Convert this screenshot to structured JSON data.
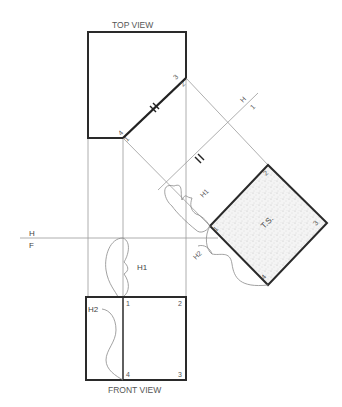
{
  "diagram": {
    "top_view_title": "TOP VIEW",
    "front_view_title": "FRONT VIEW",
    "fold_line_hf": {
      "upper": "H",
      "lower": "F"
    },
    "fold_line_h1": {
      "upper": "H",
      "lower": "1"
    },
    "true_shape_label": "T.S.",
    "distance_labels": {
      "h1": "H1",
      "h2": "H2"
    },
    "top_view_points": {
      "p4_1_left": "4",
      "p4_1_right": "1",
      "p3_2_top": "3",
      "p3_2_bottom": "2"
    },
    "front_view_points": {
      "p1": "1",
      "p2": "2",
      "p3": "3",
      "p4": "4"
    },
    "aux_view_points": {
      "p1": "1",
      "p2": "2",
      "p3": "3",
      "p4": "4"
    },
    "colors": {
      "thick_line": "#2a2a2a",
      "thin_line": "#9a9a9a",
      "stipple": "#bdbdbd"
    }
  }
}
